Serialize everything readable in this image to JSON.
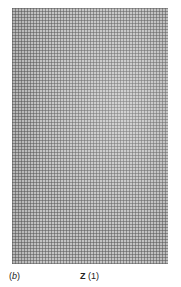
{
  "figure": {
    "panel_label_open": "(",
    "panel_label_letter": "b",
    "panel_label_close": ")",
    "caption_symbol": "Z",
    "caption_index": " (1)"
  }
}
